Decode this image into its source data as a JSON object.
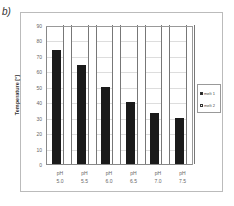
{
  "panel_label": "b)",
  "chart_data": {
    "type": "bar",
    "title": "",
    "xlabel": "",
    "ylabel": "Temperature [°]",
    "ylim": [
      0,
      90
    ],
    "yticks": [
      0,
      10,
      20,
      30,
      40,
      50,
      60,
      70,
      80,
      90
    ],
    "grid": true,
    "legend_position": "right",
    "categories": [
      "pH 5.0",
      "pH 5.5",
      "pH 6.0",
      "pH 6.5",
      "pH 7.0",
      "pH 7.5"
    ],
    "category_lines": [
      [
        "pH",
        "5.0"
      ],
      [
        "pH",
        "5.5"
      ],
      [
        "pH",
        "6.0"
      ],
      [
        "pH",
        "6.5"
      ],
      [
        "pH",
        "7.0"
      ],
      [
        "pH",
        "7.5"
      ]
    ],
    "series": [
      {
        "name": "melt 1",
        "color": "#1a1a1a",
        "values": [
          74,
          64,
          50,
          40,
          33,
          30
        ]
      },
      {
        "name": "melt 2",
        "color": "#ffffff",
        "values": [
          90,
          90,
          90,
          90,
          90,
          90
        ]
      }
    ]
  }
}
